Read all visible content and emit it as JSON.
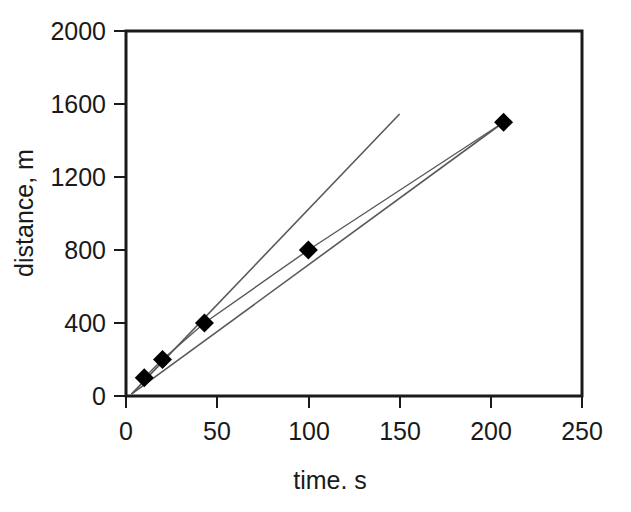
{
  "chart_data": {
    "type": "scatter",
    "title": "",
    "xlabel": "time. s",
    "ylabel": "distance, m",
    "xlim": [
      0,
      250
    ],
    "ylim": [
      0,
      2000
    ],
    "xticks": [
      0,
      50,
      100,
      150,
      200,
      250
    ],
    "yticks": [
      0,
      400,
      800,
      1200,
      1600,
      2000
    ],
    "xtick_labels": [
      "0",
      "50",
      "100",
      "150",
      "200",
      "250"
    ],
    "ytick_labels": [
      "0",
      "400",
      "800",
      "1200",
      "1600",
      "2000"
    ],
    "grid": false,
    "legend": "none",
    "frame": "box",
    "marker": "filled-diamond",
    "marker_color": "#000000",
    "line_color": "#595959",
    "series": [
      {
        "name": "measured-distance",
        "type": "scatter",
        "x": [
          10,
          20,
          43,
          100,
          207
        ],
        "y": [
          100,
          200,
          400,
          800,
          1500
        ]
      },
      {
        "name": "fit-line-shallow",
        "type": "line",
        "x": [
          3,
          207
        ],
        "y": [
          10,
          1500
        ]
      },
      {
        "name": "fit-line-steep",
        "type": "line",
        "x": [
          3,
          150
        ],
        "y": [
          10,
          1545
        ]
      }
    ]
  },
  "axes": {
    "y_title": "distance, m",
    "x_title": "time. s",
    "y_labels": {
      "t0": "2000",
      "t1": "1600",
      "t2": "1200",
      "t3": "800",
      "t4": "400",
      "t5": "0"
    },
    "x_labels": {
      "t0": "0",
      "t1": "50",
      "t2": "100",
      "t3": "150",
      "t4": "200",
      "t5": "250"
    }
  }
}
